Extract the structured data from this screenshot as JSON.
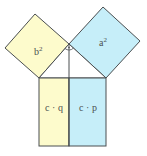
{
  "colors": {
    "yellow": "#fdfbcc",
    "blue": "#c6eef9",
    "stroke": "#4a4e50",
    "text": "#4a5050"
  },
  "labels": {
    "b_square_base": "b",
    "b_square_exp": "2",
    "a_square_base": "a",
    "a_square_exp": "2",
    "left_rect": "c · q",
    "right_rect": "c · p"
  }
}
